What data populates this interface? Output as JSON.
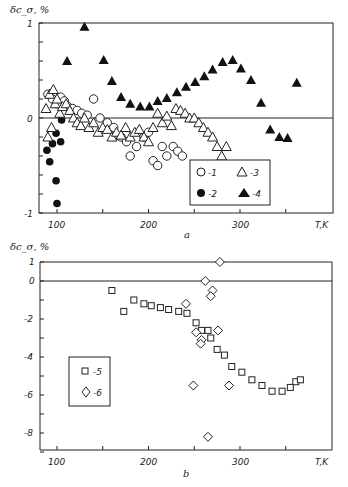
{
  "figure": {
    "panel_a_caption": "a",
    "panel_b_caption": "b",
    "ylabel": "δc_σ, %",
    "xlabel": "T, K"
  },
  "chart_data": [
    {
      "type": "scatter",
      "panel": "a",
      "title": "",
      "xlabel": "T, K",
      "ylabel": "δc_σ, %",
      "xlim": [
        80,
        400
      ],
      "ylim": [
        -1,
        1
      ],
      "xticks": [
        100,
        200,
        300
      ],
      "yticks": [
        -1,
        0,
        1
      ],
      "minor_xticks": [
        150,
        250,
        350
      ],
      "grid": false,
      "reference_line_y": 0,
      "legend": {
        "position": "lower right inside",
        "entries": [
          "-1",
          "-2",
          "-3",
          "-4"
        ]
      },
      "series": [
        {
          "name": "1",
          "marker": "open-circle",
          "x": [
            90,
            95,
            100,
            104,
            108,
            112,
            117,
            122,
            127,
            133,
            140,
            147,
            155,
            162,
            170,
            176,
            180,
            187,
            195,
            200,
            205,
            210,
            215,
            220,
            227,
            232,
            237
          ],
          "y": [
            0.25,
            0.2,
            0.15,
            0.22,
            0.18,
            0.12,
            0.1,
            0.08,
            0.05,
            0.03,
            0.2,
            0.0,
            -0.05,
            -0.1,
            -0.2,
            -0.25,
            -0.4,
            -0.3,
            -0.2,
            -0.15,
            -0.45,
            -0.5,
            -0.3,
            -0.4,
            -0.3,
            -0.35,
            -0.4
          ]
        },
        {
          "name": "2",
          "marker": "filled-circle",
          "x": [
            89,
            92,
            95,
            99,
            99,
            100,
            104,
            105
          ],
          "y": [
            -0.34,
            -0.46,
            -0.27,
            -0.16,
            -0.66,
            -0.9,
            -0.25,
            -0.02
          ]
        },
        {
          "name": "3",
          "marker": "open-triangle",
          "x": [
            88,
            90,
            92,
            94,
            96,
            98,
            100,
            103,
            106,
            110,
            114,
            118,
            122,
            126,
            130,
            135,
            140,
            145,
            150,
            155,
            160,
            165,
            170,
            175,
            180,
            185,
            190,
            195,
            200,
            205,
            210,
            215,
            220,
            225,
            230,
            235,
            240,
            245,
            250,
            255,
            260,
            265,
            270,
            275,
            280,
            285
          ],
          "y": [
            0.1,
            -0.2,
            0.25,
            -0.1,
            0.3,
            0.15,
            0.2,
            0.05,
            0.12,
            0.15,
            0.08,
            0.0,
            -0.05,
            -0.08,
            0.0,
            -0.1,
            -0.05,
            -0.15,
            -0.1,
            -0.12,
            -0.2,
            -0.15,
            -0.18,
            -0.1,
            -0.2,
            -0.15,
            -0.12,
            -0.2,
            -0.25,
            -0.1,
            0.05,
            -0.05,
            0.02,
            -0.08,
            0.1,
            0.08,
            0.05,
            0.0,
            0.0,
            -0.05,
            -0.1,
            -0.15,
            -0.2,
            -0.3,
            -0.4,
            -0.3
          ]
        },
        {
          "name": "4",
          "marker": "filled-triangle",
          "x": [
            111,
            130,
            151,
            160,
            170,
            180,
            191,
            201,
            210,
            220,
            231,
            241,
            251,
            261,
            270,
            281,
            292,
            301,
            312,
            323,
            333,
            343,
            352,
            362
          ],
          "y": [
            0.6,
            0.96,
            0.61,
            0.39,
            0.22,
            0.15,
            0.12,
            0.12,
            0.18,
            0.21,
            0.27,
            0.33,
            0.38,
            0.44,
            0.51,
            0.59,
            0.61,
            0.52,
            0.4,
            0.16,
            -0.12,
            -0.2,
            -0.21,
            0.37
          ]
        }
      ]
    },
    {
      "type": "scatter",
      "panel": "b",
      "title": "",
      "xlabel": "T, K",
      "ylabel": "δc_σ, %",
      "xlim": [
        80,
        400
      ],
      "ylim": [
        -9,
        1
      ],
      "xticks": [
        100,
        200,
        300
      ],
      "yticks": [
        1,
        0,
        -2,
        -4,
        -6,
        -8
      ],
      "minor_xticks": [
        150,
        250,
        350
      ],
      "grid": false,
      "reference_lines_y": [
        0,
        1
      ],
      "legend": {
        "position": "left inside",
        "entries": [
          "-5",
          "-6"
        ]
      },
      "series": [
        {
          "name": "5",
          "marker": "open-square",
          "x": [
            160,
            173,
            184,
            195,
            203,
            213,
            222,
            233,
            242,
            252,
            258,
            265,
            268,
            275,
            283,
            291,
            302,
            313,
            324,
            335,
            346,
            355,
            361,
            366
          ],
          "y": [
            -0.5,
            -1.6,
            -1.0,
            -1.2,
            -1.3,
            -1.4,
            -1.5,
            -1.6,
            -1.7,
            -2.2,
            -2.6,
            -2.6,
            -3.0,
            -3.6,
            -3.9,
            -4.5,
            -4.8,
            -5.2,
            -5.5,
            -5.8,
            -5.8,
            -5.6,
            -5.3,
            -5.2
          ]
        },
        {
          "name": "6",
          "marker": "open-diamond",
          "x": [
            278,
            262,
            270,
            268,
            241,
            252,
            258,
            276,
            257,
            249,
            288,
            265
          ],
          "y": [
            1.0,
            0.0,
            -0.5,
            -0.8,
            -1.2,
            -2.7,
            -3.1,
            -2.6,
            -3.3,
            -5.5,
            -5.5,
            -8.2
          ]
        }
      ]
    }
  ],
  "axis_labels": {
    "a": {
      "y_top": "1",
      "y_zero": "0",
      "y_bottom": "-1",
      "x": [
        "100",
        "200",
        "300"
      ],
      "x_unit": "T,K"
    },
    "b": {
      "y": [
        "1",
        "0",
        "-2",
        "-4",
        "-6",
        "-8"
      ],
      "x": [
        "100",
        "200",
        "300"
      ],
      "x_unit": "T,K"
    }
  },
  "legends": {
    "a": [
      "-1",
      "-2",
      "-3",
      "-4"
    ],
    "b": [
      "-5",
      "-6"
    ]
  }
}
